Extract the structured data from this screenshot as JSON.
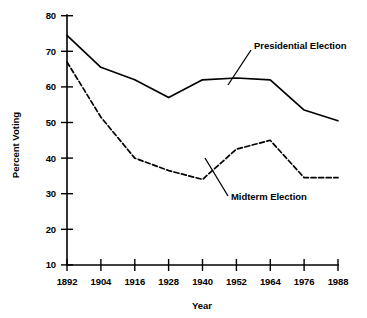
{
  "chart_data": {
    "type": "line",
    "title": "",
    "subtitle": "",
    "xlabel": "Year",
    "ylabel": "Percent Voting",
    "categories": [
      "1892",
      "1904",
      "1916",
      "1928",
      "1940",
      "1952",
      "1964",
      "1976",
      "1988"
    ],
    "x": [
      1892,
      1904,
      1916,
      1928,
      1940,
      1952,
      1964,
      1976,
      1988
    ],
    "xlim": [
      1892,
      1988
    ],
    "ylim": [
      10,
      80
    ],
    "y_ticks": [
      10,
      20,
      30,
      40,
      50,
      60,
      70,
      80
    ],
    "x_ticks": [
      1892,
      1904,
      1916,
      1928,
      1940,
      1952,
      1964,
      1976,
      1988
    ],
    "grid": false,
    "legend_position": "inline-annotations",
    "series": [
      {
        "name": "Presidential Election",
        "style": "solid",
        "color": "#000000",
        "values": [
          74.5,
          65.5,
          62.0,
          57.0,
          62.0,
          62.5,
          62.0,
          53.5,
          50.5
        ]
      },
      {
        "name": "Midterm Election",
        "style": "dashed",
        "color": "#000000",
        "values": [
          67.0,
          51.5,
          40.0,
          36.5,
          34.0,
          42.5,
          45.0,
          34.5,
          34.5
        ]
      }
    ],
    "annotations": [
      {
        "text": "Presidential Election",
        "target_series": "Presidential Election"
      },
      {
        "text": "Midterm Election",
        "target_series": "Midterm Election"
      }
    ]
  },
  "axes": {
    "y_labels": [
      "80",
      "70",
      "60",
      "50",
      "40",
      "30",
      "20",
      "10"
    ],
    "x_labels": [
      "1892",
      "1904",
      "1916",
      "1928",
      "1940",
      "1952",
      "1964",
      "1976",
      "1988"
    ],
    "y_title": "Percent Voting",
    "x_title": "Year"
  },
  "annotations": {
    "presidential": "Presidential Election",
    "midterm": "Midterm Election"
  },
  "colors": {
    "ink": "#000000",
    "background": "#ffffff"
  }
}
